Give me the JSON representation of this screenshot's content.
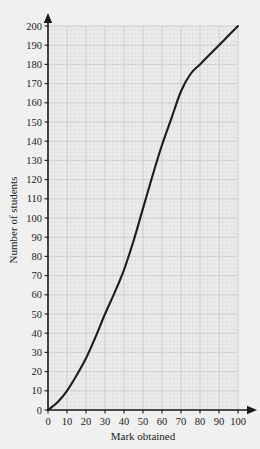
{
  "chart_data": {
    "type": "line",
    "title": "",
    "subtitle": "",
    "xlabel": "Mark obtained",
    "ylabel": "Number of students",
    "xlim": [
      0,
      100
    ],
    "ylim": [
      0,
      200
    ],
    "xticks": [
      0,
      10,
      20,
      30,
      40,
      50,
      60,
      70,
      80,
      90,
      100
    ],
    "yticks": [
      0,
      10,
      20,
      30,
      40,
      50,
      60,
      70,
      80,
      90,
      100,
      110,
      120,
      130,
      140,
      150,
      160,
      170,
      180,
      190,
      200
    ],
    "xtick_labels": [
      "0",
      "10",
      "20",
      "30",
      "40",
      "50",
      "60",
      "70",
      "80",
      "90",
      "100"
    ],
    "ytick_labels": [
      "0",
      "10",
      "20",
      "30",
      "40",
      "50",
      "60",
      "70",
      "80",
      "90",
      "100",
      "110",
      "120",
      "130",
      "140",
      "150",
      "160",
      "170",
      "180",
      "190",
      "200"
    ],
    "grid": true,
    "grid_minor": true,
    "grid_color": "#c9c9c9",
    "grid_minor_color": "#dddddd",
    "legend": null,
    "legend_position": "none",
    "series": [
      {
        "name": "Cumulative frequency",
        "color": "#1c1c1c",
        "line_width": 2.1,
        "x": [
          0,
          5,
          10,
          15,
          20,
          25,
          30,
          35,
          40,
          45,
          50,
          55,
          60,
          65,
          70,
          75,
          80,
          85,
          90,
          95,
          100
        ],
        "values": [
          0,
          4,
          10,
          18,
          27,
          38,
          50,
          61,
          73,
          88,
          105,
          122,
          138,
          152,
          166,
          175,
          180,
          185,
          190,
          195,
          200
        ]
      }
    ],
    "annotations": []
  },
  "axes": {
    "x_axis_name": "x-axis",
    "y_axis_name": "y-axis",
    "arrow_heads": true
  },
  "colors": {
    "background": "#f0f0f0",
    "plot_background": "#ececec",
    "axis": "#1a1a1a",
    "curve": "#1c1c1c"
  }
}
